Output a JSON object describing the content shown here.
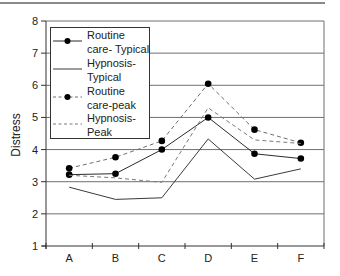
{
  "figure": {
    "top_rule": true
  },
  "chart_data": {
    "type": "line",
    "title": "",
    "xlabel": "",
    "ylabel": "Distress",
    "categories": [
      "A",
      "B",
      "C",
      "D",
      "E",
      "F"
    ],
    "ylim": [
      1,
      8
    ],
    "yticks": [
      1,
      2,
      3,
      4,
      5,
      6,
      7,
      8
    ],
    "grid": true,
    "legend_position": "upper-left-inside",
    "series": [
      {
        "name": "Routine care- Typical",
        "legend_lines": [
          "Routine",
          "care- Typical"
        ],
        "style": "solid",
        "marker": "dot",
        "color": "#2b2b2b",
        "values": [
          3.22,
          3.25,
          4.0,
          5.0,
          3.87,
          3.72
        ]
      },
      {
        "name": "Hypnosis-Typical",
        "legend_lines": [
          "Hypnosis-",
          "Typical"
        ],
        "style": "solid",
        "marker": "none",
        "color": "#3a3a3a",
        "values": [
          2.83,
          2.45,
          2.5,
          4.33,
          3.08,
          3.4
        ]
      },
      {
        "name": "Routine care-peak",
        "legend_lines": [
          "Routine",
          "care-peak"
        ],
        "style": "dashed",
        "marker": "dot",
        "color": "#6e6e6e",
        "values": [
          3.42,
          3.76,
          4.27,
          6.05,
          4.62,
          4.21
        ]
      },
      {
        "name": "Hypnosis-Peak",
        "legend_lines": [
          "Hypnosis-",
          "Peak"
        ],
        "style": "dashed",
        "marker": "none",
        "color": "#7a7a7a",
        "values": [
          3.2,
          3.12,
          2.98,
          5.3,
          4.3,
          4.19
        ]
      }
    ]
  }
}
